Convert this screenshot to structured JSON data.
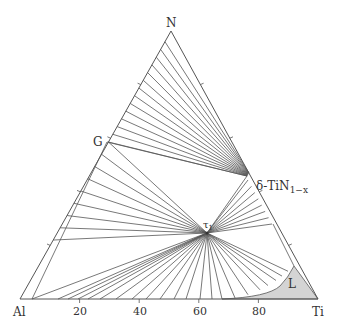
{
  "diagram": {
    "type": "ternary-phase-diagram",
    "vertices": {
      "top": "N",
      "left": "Al",
      "right": "Ti"
    },
    "axis_ticks": [
      "20",
      "40",
      "60",
      "80"
    ],
    "phase_labels": {
      "G": "G",
      "delta_prefix": "δ-TiN",
      "delta_sub": "1−x",
      "tau1": "τ",
      "tau1_sub": "1",
      "liquid": "L"
    },
    "colors": {
      "lines": "#555555",
      "liquid_fill": "#d4d4d4",
      "text": "#333333"
    }
  }
}
